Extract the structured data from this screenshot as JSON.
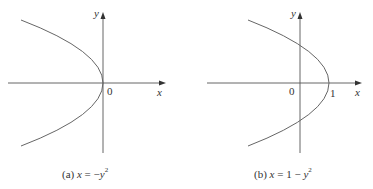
{
  "figures": [
    {
      "id": "a",
      "caption_prefix": "(a)",
      "caption_eq_lhs": "x",
      "caption_eq_mid": " = −",
      "caption_eq_var": "y",
      "caption_exp": "2",
      "axis_x_label": "x",
      "axis_y_label": "y",
      "origin_label": "0",
      "equation": "x = -y^2"
    },
    {
      "id": "b",
      "caption_prefix": "(b)",
      "caption_eq_lhs": "x",
      "caption_eq_mid": " = 1 − ",
      "caption_eq_var": "y",
      "caption_exp": "2",
      "axis_x_label": "x",
      "axis_y_label": "y",
      "origin_label": "0",
      "tick_label": "1",
      "equation": "x = 1 - y^2"
    }
  ],
  "colors": {
    "axis": "#555555",
    "curve": "#666666",
    "text": "#333333"
  }
}
